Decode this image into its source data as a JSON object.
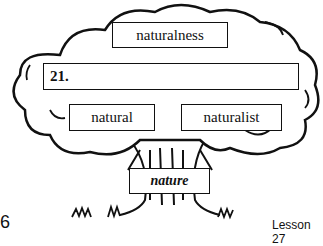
{
  "tree": {
    "top_word": "naturalness",
    "answer_box": {
      "number": "21.",
      "value": ""
    },
    "left_word": "natural",
    "right_word": "naturalist",
    "root_word": "nature"
  },
  "footer": {
    "page_number": "6",
    "lesson": "Lesson 27"
  }
}
